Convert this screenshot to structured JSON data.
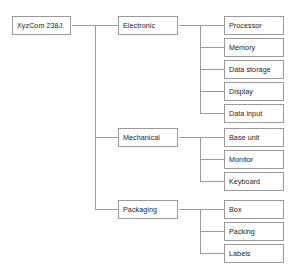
{
  "diagram": {
    "type": "tree",
    "orientation": "left-to-right",
    "style": {
      "line_color": "#9a9a9a",
      "box_border_color": "#9a9a9a",
      "box_fill_color": "#ffffff",
      "text_color": "#1d1d1d",
      "background_color": "#ffffff"
    },
    "root": {
      "label": "XyzCom 238J."
    },
    "groups": [
      {
        "label": "Electronic",
        "children": [
          {
            "label": "Processor"
          },
          {
            "label": "Memory"
          },
          {
            "label": "Data storage"
          },
          {
            "label": "Display"
          },
          {
            "label": "Data input"
          }
        ]
      },
      {
        "label": "Mechanical",
        "children": [
          {
            "label": "Base unit"
          },
          {
            "label": "Monitor"
          },
          {
            "label": "Keyboard"
          }
        ]
      },
      {
        "label": "Packaging",
        "children": [
          {
            "label": "Box"
          },
          {
            "label": "Packing"
          },
          {
            "label": "Labels"
          }
        ]
      }
    ]
  }
}
